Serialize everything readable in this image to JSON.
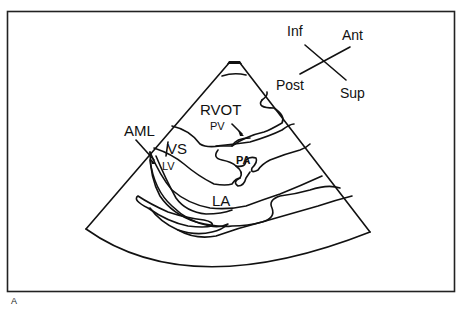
{
  "figure": {
    "panel_letter": "A",
    "orientation": {
      "inf": "Inf",
      "ant": "Ant",
      "post": "Post",
      "sup": "Sup"
    },
    "structures": {
      "rvot": "RVOT",
      "pv": "PV",
      "aml": "AML",
      "vs": "VS",
      "lv": "LV",
      "pa": "PA",
      "la": "LA"
    },
    "colors": {
      "line": "#111111",
      "background": "#ffffff"
    }
  }
}
